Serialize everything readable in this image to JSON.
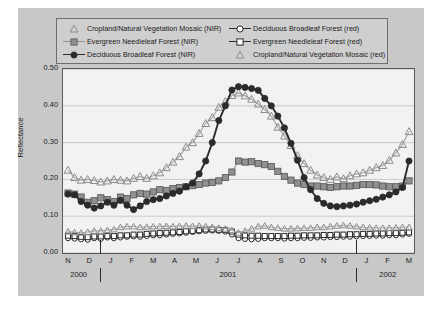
{
  "chart_data": {
    "type": "line",
    "title": "",
    "xlabel": "",
    "ylabel": "Reflectance",
    "ylim": [
      0.0,
      0.5
    ],
    "ytick_labels": [
      "0.50",
      "0.40",
      "0.30",
      "0.20",
      "0.10",
      "0.00"
    ],
    "ytick_values": [
      0.5,
      0.4,
      0.3,
      0.2,
      0.1,
      0.0
    ],
    "grid": true,
    "legend_position": "top",
    "x_tick_labels": [
      "N",
      "D",
      "J",
      "F",
      "M",
      "A",
      "M",
      "J",
      "J",
      "A",
      "S",
      "O",
      "N",
      "D",
      "J",
      "F",
      "M"
    ],
    "x_group_labels": [
      "2000",
      "2001",
      "2002"
    ],
    "x_group_centers": [
      0.5,
      7.5,
      15.0
    ],
    "x_group_separators": [
      1.5,
      13.5
    ],
    "x_start_month_index": 0,
    "x_end_month_index": 16,
    "points_per_month": 2,
    "series": [
      {
        "name": "Cropland/Natural Vegetation Mosaic (NIR)",
        "band": "NIR",
        "marker": "triangle-open",
        "color": "#8c8c8c",
        "line_color": "#a8a8a8",
        "values": [
          0.225,
          0.205,
          0.198,
          0.2,
          0.197,
          0.193,
          0.196,
          0.2,
          0.198,
          0.196,
          0.203,
          0.208,
          0.203,
          0.21,
          0.218,
          0.232,
          0.247,
          0.262,
          0.288,
          0.3,
          0.325,
          0.352,
          0.368,
          0.396,
          0.412,
          0.428,
          0.435,
          0.427,
          0.418,
          0.405,
          0.39,
          0.372,
          0.342,
          0.318,
          0.292,
          0.265,
          0.243,
          0.225,
          0.212,
          0.205,
          0.2,
          0.207,
          0.202,
          0.21,
          0.215,
          0.218,
          0.225,
          0.232,
          0.238,
          0.252,
          0.272,
          0.295,
          0.33
        ]
      },
      {
        "name": "Evergreen Needleleaf Forest (NIR)",
        "band": "NIR",
        "marker": "square-filled",
        "color": "#909090",
        "line_color": "#999999",
        "values": [
          0.163,
          0.16,
          0.152,
          0.138,
          0.142,
          0.15,
          0.145,
          0.14,
          0.152,
          0.148,
          0.158,
          0.162,
          0.16,
          0.166,
          0.172,
          0.17,
          0.175,
          0.178,
          0.18,
          0.183,
          0.186,
          0.19,
          0.192,
          0.196,
          0.205,
          0.22,
          0.25,
          0.247,
          0.248,
          0.243,
          0.24,
          0.235,
          0.222,
          0.208,
          0.198,
          0.19,
          0.186,
          0.182,
          0.182,
          0.18,
          0.178,
          0.18,
          0.182,
          0.182,
          0.184,
          0.186,
          0.186,
          0.185,
          0.182,
          0.18,
          0.18,
          0.182,
          0.196
        ]
      },
      {
        "name": "Deciduous Broadleaf Forest (NIR)",
        "band": "NIR",
        "marker": "circle-filled",
        "color": "#2b2b2b",
        "line_color": "#2b2b2b",
        "values": [
          0.16,
          0.158,
          0.14,
          0.13,
          0.122,
          0.128,
          0.138,
          0.13,
          0.143,
          0.13,
          0.118,
          0.128,
          0.14,
          0.145,
          0.148,
          0.155,
          0.162,
          0.168,
          0.18,
          0.19,
          0.215,
          0.25,
          0.3,
          0.36,
          0.4,
          0.443,
          0.452,
          0.45,
          0.447,
          0.442,
          0.42,
          0.4,
          0.372,
          0.34,
          0.298,
          0.252,
          0.205,
          0.172,
          0.148,
          0.135,
          0.128,
          0.126,
          0.128,
          0.13,
          0.133,
          0.138,
          0.142,
          0.146,
          0.152,
          0.158,
          0.166,
          0.178,
          0.25
        ]
      },
      {
        "name": "Deciduous Broadleaf Forest (red)",
        "band": "red",
        "marker": "circle-open",
        "color": "#2b2b2b",
        "line_color": "#2b2b2b",
        "values": [
          0.04,
          0.039,
          0.037,
          0.036,
          0.04,
          0.038,
          0.042,
          0.04,
          0.042,
          0.044,
          0.045,
          0.044,
          0.046,
          0.048,
          0.048,
          0.05,
          0.052,
          0.053,
          0.055,
          0.057,
          0.059,
          0.06,
          0.061,
          0.06,
          0.058,
          0.05,
          0.04,
          0.038,
          0.037,
          0.038,
          0.04,
          0.04,
          0.04,
          0.039,
          0.04,
          0.04,
          0.041,
          0.041,
          0.042,
          0.042,
          0.043,
          0.043,
          0.044,
          0.044,
          0.045,
          0.046,
          0.046,
          0.047,
          0.047,
          0.048,
          0.048,
          0.05,
          0.052
        ]
      },
      {
        "name": "Evergreen Needleleaf Forest (red)",
        "band": "red",
        "marker": "square-open",
        "color": "#2b2b2b",
        "line_color": "#4a4a4a",
        "values": [
          0.047,
          0.046,
          0.044,
          0.043,
          0.045,
          0.045,
          0.046,
          0.046,
          0.048,
          0.048,
          0.05,
          0.05,
          0.052,
          0.053,
          0.054,
          0.055,
          0.056,
          0.057,
          0.059,
          0.06,
          0.062,
          0.064,
          0.064,
          0.063,
          0.062,
          0.058,
          0.05,
          0.048,
          0.047,
          0.047,
          0.046,
          0.046,
          0.046,
          0.046,
          0.047,
          0.047,
          0.048,
          0.048,
          0.048,
          0.049,
          0.049,
          0.05,
          0.05,
          0.051,
          0.051,
          0.052,
          0.052,
          0.053,
          0.053,
          0.054,
          0.054,
          0.055,
          0.056
        ]
      },
      {
        "name": "Cropland/Natural Vegetation Mosaic (red)",
        "band": "red",
        "marker": "triangle-open",
        "color": "#8c8c8c",
        "line_color": "#b0b0b0",
        "values": [
          0.058,
          0.056,
          0.055,
          0.057,
          0.06,
          0.06,
          0.062,
          0.064,
          0.07,
          0.072,
          0.072,
          0.07,
          0.071,
          0.072,
          0.072,
          0.073,
          0.072,
          0.073,
          0.074,
          0.073,
          0.074,
          0.072,
          0.07,
          0.068,
          0.066,
          0.062,
          0.055,
          0.06,
          0.066,
          0.072,
          0.074,
          0.07,
          0.068,
          0.066,
          0.066,
          0.067,
          0.068,
          0.068,
          0.07,
          0.07,
          0.072,
          0.074,
          0.075,
          0.074,
          0.072,
          0.07,
          0.069,
          0.068,
          0.068,
          0.068,
          0.069,
          0.07,
          0.07
        ]
      }
    ]
  },
  "legend": {
    "left_column": [
      {
        "label": "Cropland/Natural Vegetation Mosaic (NIR)",
        "marker": "triangle-open",
        "line": false,
        "color": "#8c8c8c"
      },
      {
        "label": "Evergreen Needleleaf Forest (NIR)",
        "marker": "square-filled",
        "line": true,
        "color": "#909090"
      },
      {
        "label": "Deciduous Broadleaf Forest (NIR)",
        "marker": "circle-filled",
        "line": true,
        "color": "#2b2b2b"
      }
    ],
    "right_column": [
      {
        "label": "Deciduous Broadleaf Forest (red)",
        "marker": "circle-open",
        "line": true,
        "color": "#2b2b2b"
      },
      {
        "label": "Evergreen Needleleaf Forest (red)",
        "marker": "square-open",
        "line": true,
        "color": "#2b2b2b"
      },
      {
        "label": "Cropland/Natural Vegetation Mosaic (red)",
        "marker": "triangle-open",
        "line": false,
        "color": "#8c8c8c"
      }
    ]
  },
  "colors": {
    "figure_background": "#c8c8c8",
    "plot_background": "#f2f2f2",
    "legend_background": "#cfcfcf",
    "grid": "#b9b9b9",
    "axis": "#5a5a5a",
    "text": "#1a1a1a"
  }
}
